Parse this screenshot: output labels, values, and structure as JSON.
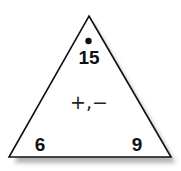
{
  "fact_triangle": {
    "top": "15",
    "bottom_left": "6",
    "bottom_right": "9",
    "operations": "+,−",
    "top_marker": "dot"
  },
  "colors": {
    "stroke": "#111111",
    "fill": "#ffffff",
    "shadow": "#bdbdbd"
  }
}
